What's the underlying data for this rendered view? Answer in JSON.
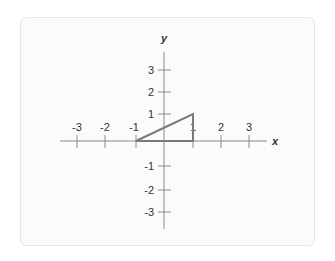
{
  "diagram": {
    "type": "coordinate-plane",
    "axes": {
      "x_label": "x",
      "y_label": "y",
      "x_range": [
        -3,
        3
      ],
      "y_range": [
        -3,
        3
      ],
      "x_ticks": [
        "-3",
        "-2",
        "-1",
        "1",
        "2",
        "3"
      ],
      "y_ticks": [
        "3",
        "2",
        "1",
        "-1",
        "-2",
        "-3"
      ]
    },
    "shape": {
      "kind": "right-triangle",
      "vertices": [
        [
          -1,
          0
        ],
        [
          1,
          1
        ],
        [
          1,
          0
        ]
      ]
    },
    "colors": {
      "axis": "#8a8a8a",
      "triangle": "#7a7a7a",
      "label": "#333333",
      "card_background": "#fbfbfb",
      "card_border": "#e6e6e6"
    }
  }
}
